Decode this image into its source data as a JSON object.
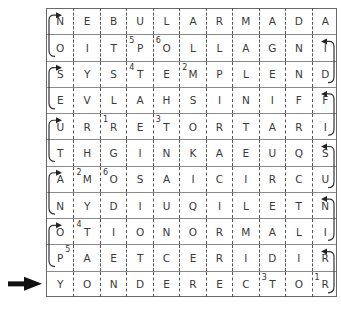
{
  "puzzle": {
    "type": "snake-word-grid",
    "rows": 11,
    "cols": 11,
    "grid": [
      [
        "N",
        "E",
        "B",
        "U",
        "L",
        "A",
        "R",
        "M",
        "A",
        "D",
        "A"
      ],
      [
        "O",
        "I",
        "T",
        "P",
        "O",
        "L",
        "L",
        "A",
        "G",
        "N",
        "I"
      ],
      [
        "S",
        "Y",
        "S",
        "T",
        "E",
        "M",
        "P",
        "L",
        "E",
        "N",
        "D"
      ],
      [
        "E",
        "V",
        "L",
        "A",
        "H",
        "S",
        "I",
        "N",
        "I",
        "F",
        "F"
      ],
      [
        "U",
        "R",
        "R",
        "E",
        "T",
        "O",
        "R",
        "T",
        "A",
        "R",
        "I"
      ],
      [
        "T",
        "H",
        "G",
        "I",
        "N",
        "K",
        "A",
        "E",
        "U",
        "Q",
        "S"
      ],
      [
        "A",
        "M",
        "O",
        "S",
        "A",
        "I",
        "C",
        "I",
        "R",
        "C",
        "U"
      ],
      [
        "N",
        "Y",
        "D",
        "I",
        "U",
        "Q",
        "I",
        "L",
        "E",
        "T",
        "N"
      ],
      [
        "O",
        "T",
        "I",
        "O",
        "N",
        "O",
        "R",
        "M",
        "A",
        "L",
        "I"
      ],
      [
        "P",
        "A",
        "E",
        "T",
        "C",
        "E",
        "R",
        "I",
        "D",
        "I",
        "R"
      ],
      [
        "Y",
        "O",
        "N",
        "D",
        "E",
        "R",
        "E",
        "C",
        "T",
        "O",
        "R"
      ]
    ],
    "clue_numbers": [
      {
        "row": 1,
        "col": 3,
        "number": "5"
      },
      {
        "row": 1,
        "col": 4,
        "number": "6"
      },
      {
        "row": 2,
        "col": 3,
        "number": "4"
      },
      {
        "row": 2,
        "col": 5,
        "number": "2"
      },
      {
        "row": 4,
        "col": 2,
        "number": "1"
      },
      {
        "row": 4,
        "col": 4,
        "number": "3"
      },
      {
        "row": 6,
        "col": 1,
        "number": "2"
      },
      {
        "row": 6,
        "col": 2,
        "number": "6"
      },
      {
        "row": 8,
        "col": 1,
        "number": "4"
      },
      {
        "row": 9,
        "col": 0,
        "number": "5",
        "position": "after-letter"
      },
      {
        "row": 10,
        "col": 8,
        "number": "3"
      },
      {
        "row": 10,
        "col": 10,
        "number": "1"
      }
    ],
    "start_row": 10,
    "start_arrow": "arrow-right-icon",
    "connectors": {
      "left_pairs": [
        [
          0,
          1
        ],
        [
          2,
          3
        ],
        [
          4,
          5
        ],
        [
          6,
          7
        ],
        [
          8,
          9
        ]
      ],
      "right_pairs": [
        [
          1,
          2
        ],
        [
          3,
          4
        ],
        [
          5,
          6
        ],
        [
          7,
          8
        ],
        [
          9,
          10
        ]
      ]
    }
  }
}
